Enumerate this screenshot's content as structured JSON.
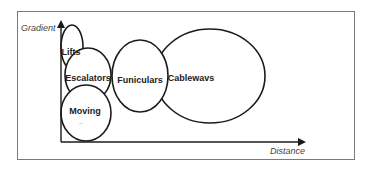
{
  "diagram": {
    "type": "overlapping-ellipses-on-axes",
    "axes": {
      "y_label": "Gradient",
      "x_label": "Distance"
    },
    "elements": [
      {
        "id": "lifts",
        "label": "Lifts",
        "cx": 72,
        "cy": 47,
        "rx": 11,
        "ry": 22
      },
      {
        "id": "escalators",
        "label": "Escalators",
        "cx": 88,
        "cy": 75,
        "rx": 23,
        "ry": 27
      },
      {
        "id": "moving",
        "label": "Moving",
        "sub": "..",
        "cx": 86,
        "cy": 113,
        "rx": 25,
        "ry": 28
      },
      {
        "id": "funiculars",
        "label": "Funiculars",
        "cx": 140,
        "cy": 76,
        "rx": 28,
        "ry": 36
      },
      {
        "id": "cableways",
        "label": "Cablewavs",
        "cx": 210,
        "cy": 76,
        "rx": 55,
        "ry": 47
      }
    ],
    "colors": {
      "stroke": "#1a1a1a",
      "frame": "#7a7a7a",
      "axis_label": "#444444"
    }
  }
}
